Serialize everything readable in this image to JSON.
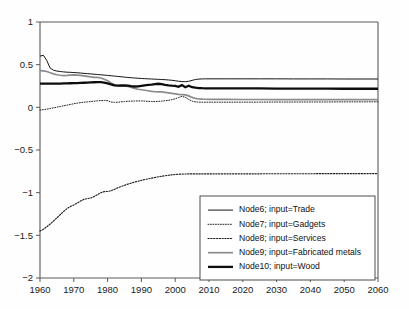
{
  "chart_data": {
    "type": "line",
    "title": "",
    "xlabel": "",
    "ylabel": "",
    "xlim": [
      1960,
      2060
    ],
    "ylim": [
      -2,
      1
    ],
    "grid": false,
    "legend_position": "lower-right-inside",
    "xticks": [
      "1960",
      "1970",
      "1980",
      "1990",
      "2000",
      "2010",
      "2020",
      "2030",
      "2040",
      "2050",
      "2060"
    ],
    "xtick_values": [
      1960,
      1970,
      1980,
      1990,
      2000,
      2010,
      2020,
      2030,
      2040,
      2050,
      2060
    ],
    "yticks": [
      "1",
      "0.5",
      "0",
      "−0.5",
      "−1",
      "−1.5",
      "−2"
    ],
    "ytick_values": [
      1,
      0.5,
      0,
      -0.5,
      -1,
      -1.5,
      -2
    ],
    "x": [
      1960,
      1961,
      1962,
      1963,
      1964,
      1965,
      1966,
      1967,
      1968,
      1969,
      1970,
      1971,
      1972,
      1973,
      1974,
      1975,
      1976,
      1977,
      1978,
      1979,
      1980,
      1981,
      1982,
      1983,
      1984,
      1985,
      1986,
      1987,
      1988,
      1989,
      1990,
      1991,
      1992,
      1993,
      1994,
      1995,
      1996,
      1997,
      1998,
      1999,
      2000,
      2001,
      2002,
      2003,
      2004,
      2005,
      2006,
      2007,
      2008,
      2009,
      2010,
      2015,
      2020,
      2025,
      2030,
      2035,
      2040,
      2045,
      2050,
      2055,
      2060
    ],
    "series": [
      {
        "name": "Node6; input=Trade",
        "style": "solid-thin",
        "color": "#151515",
        "values": [
          0.6,
          0.61,
          0.55,
          0.46,
          0.435,
          0.425,
          0.42,
          0.415,
          0.412,
          0.41,
          0.408,
          0.405,
          0.402,
          0.398,
          0.395,
          0.392,
          0.388,
          0.385,
          0.381,
          0.378,
          0.374,
          0.37,
          0.366,
          0.362,
          0.358,
          0.354,
          0.35,
          0.347,
          0.344,
          0.341,
          0.338,
          0.336,
          0.334,
          0.332,
          0.33,
          0.328,
          0.326,
          0.324,
          0.321,
          0.317,
          0.312,
          0.306,
          0.302,
          0.3,
          0.305,
          0.316,
          0.326,
          0.331,
          0.333,
          0.334,
          0.334,
          0.334,
          0.334,
          0.334,
          0.334,
          0.333,
          0.333,
          0.333,
          0.332,
          0.332,
          0.332
        ]
      },
      {
        "name": "Node7; input=Gadgets",
        "style": "dotted-fine",
        "color": "#202020",
        "values": [
          -0.032,
          -0.028,
          -0.022,
          -0.014,
          -0.006,
          0.002,
          0.01,
          0.018,
          0.026,
          0.034,
          0.042,
          0.049,
          0.055,
          0.06,
          0.064,
          0.068,
          0.072,
          0.076,
          0.079,
          0.08,
          0.078,
          0.062,
          0.058,
          0.06,
          0.064,
          0.068,
          0.071,
          0.073,
          0.074,
          0.075,
          0.075,
          0.073,
          0.07,
          0.068,
          0.068,
          0.07,
          0.073,
          0.077,
          0.082,
          0.09,
          0.1,
          0.115,
          0.128,
          0.118,
          0.092,
          0.072,
          0.064,
          0.061,
          0.06,
          0.06,
          0.06,
          0.06,
          0.061,
          0.061,
          0.062,
          0.062,
          0.063,
          0.063,
          0.064,
          0.064,
          0.065
        ]
      },
      {
        "name": "Node8; input=Services",
        "style": "dotted-coarse",
        "color": "#202020",
        "values": [
          -1.45,
          -1.43,
          -1.4,
          -1.368,
          -1.332,
          -1.295,
          -1.258,
          -1.22,
          -1.186,
          -1.162,
          -1.144,
          -1.122,
          -1.098,
          -1.078,
          -1.07,
          -1.062,
          -1.046,
          -1.024,
          -1.0,
          -0.988,
          -0.986,
          -0.978,
          -0.962,
          -0.944,
          -0.928,
          -0.914,
          -0.9,
          -0.888,
          -0.876,
          -0.866,
          -0.856,
          -0.846,
          -0.838,
          -0.83,
          -0.822,
          -0.814,
          -0.808,
          -0.802,
          -0.796,
          -0.791,
          -0.787,
          -0.784,
          -0.782,
          -0.781,
          -0.78,
          -0.78,
          -0.78,
          -0.78,
          -0.78,
          -0.78,
          -0.78,
          -0.779,
          -0.779,
          -0.779,
          -0.778,
          -0.778,
          -0.778,
          -0.777,
          -0.777,
          -0.777,
          -0.776
        ]
      },
      {
        "name": "Node9; input=Fabricated metals",
        "style": "solid-gray",
        "color": "#8c8c8c",
        "values": [
          0.43,
          0.428,
          0.42,
          0.406,
          0.392,
          0.382,
          0.376,
          0.372,
          0.374,
          0.378,
          0.38,
          0.378,
          0.374,
          0.368,
          0.362,
          0.356,
          0.352,
          0.35,
          0.344,
          0.33,
          0.312,
          0.286,
          0.266,
          0.256,
          0.252,
          0.25,
          0.244,
          0.234,
          0.222,
          0.212,
          0.206,
          0.2,
          0.194,
          0.188,
          0.184,
          0.182,
          0.18,
          0.176,
          0.17,
          0.164,
          0.158,
          0.152,
          0.15,
          0.146,
          0.134,
          0.116,
          0.104,
          0.098,
          0.096,
          0.095,
          0.094,
          0.093,
          0.092,
          0.092,
          0.091,
          0.091,
          0.09,
          0.09,
          0.09,
          0.09,
          0.09
        ]
      },
      {
        "name": "Node10; input=Wood",
        "style": "solid-thick",
        "color": "#0d0d0d",
        "values": [
          0.278,
          0.278,
          0.278,
          0.278,
          0.278,
          0.278,
          0.279,
          0.28,
          0.281,
          0.282,
          0.283,
          0.284,
          0.286,
          0.288,
          0.29,
          0.292,
          0.294,
          0.296,
          0.296,
          0.29,
          0.28,
          0.268,
          0.258,
          0.254,
          0.256,
          0.258,
          0.254,
          0.248,
          0.244,
          0.246,
          0.252,
          0.258,
          0.262,
          0.266,
          0.272,
          0.276,
          0.272,
          0.264,
          0.258,
          0.254,
          0.252,
          0.24,
          0.262,
          0.236,
          0.254,
          0.236,
          0.23,
          0.226,
          0.224,
          0.223,
          0.222,
          0.222,
          0.221,
          0.221,
          0.22,
          0.22,
          0.219,
          0.219,
          0.218,
          0.218,
          0.218
        ]
      }
    ]
  },
  "legend": {
    "items": [
      {
        "label": "Node6; input=Trade",
        "swatch": "solid-thin"
      },
      {
        "label": "Node7; input=Gadgets",
        "swatch": "dotted-fine"
      },
      {
        "label": "Node8; input=Services",
        "swatch": "dotted-coarse"
      },
      {
        "label": "Node9; input=Fabricated metals",
        "swatch": "solid-gray"
      },
      {
        "label": "Node10; input=Wood",
        "swatch": "solid-thick"
      }
    ]
  }
}
